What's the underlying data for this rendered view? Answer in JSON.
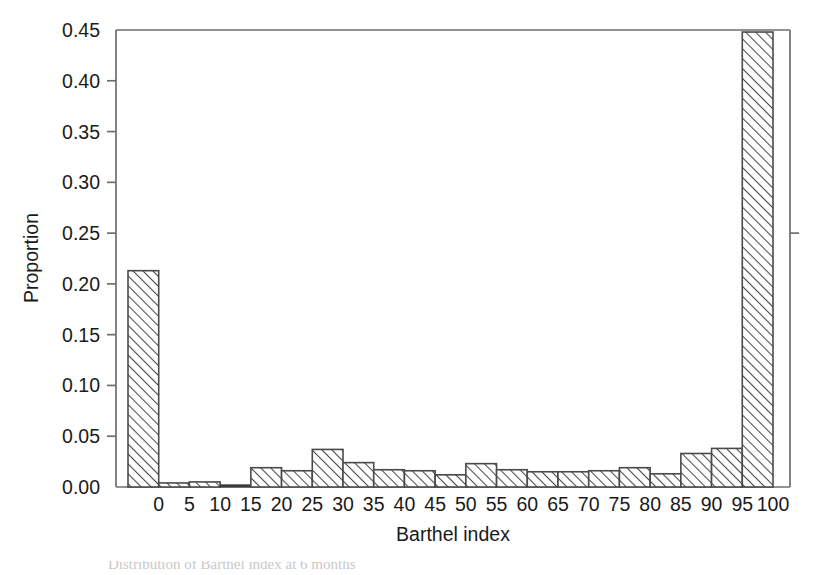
{
  "chart_data": {
    "type": "bar",
    "title": "",
    "xlabel": "Barthel index",
    "ylabel": "Proportion",
    "ylim": [
      0.0,
      0.45
    ],
    "ytick_labels": [
      "0.00",
      "0.05",
      "0.10",
      "0.15",
      "0.20",
      "0.25",
      "0.30",
      "0.35",
      "0.40",
      "0.45"
    ],
    "ytick_values": [
      0.0,
      0.05,
      0.1,
      0.15,
      0.2,
      0.25,
      0.3,
      0.35,
      0.4,
      0.45
    ],
    "xtick_labels": [
      "0",
      "5",
      "10",
      "15",
      "20",
      "25",
      "30",
      "35",
      "40",
      "45",
      "50",
      "55",
      "60",
      "65",
      "70",
      "75",
      "80",
      "85",
      "90",
      "95",
      "100"
    ],
    "xtick_values": [
      0,
      5,
      10,
      15,
      20,
      25,
      30,
      35,
      40,
      45,
      50,
      55,
      60,
      65,
      70,
      75,
      80,
      85,
      90,
      95,
      100
    ],
    "grid": false,
    "legend": false,
    "bar_style": "diagonal-hatch",
    "categories": [
      "0",
      "5",
      "10",
      "15",
      "20",
      "25",
      "30",
      "35",
      "40",
      "45",
      "50",
      "55",
      "60",
      "65",
      "70",
      "75",
      "80",
      "85",
      "90",
      "95",
      "100"
    ],
    "values": [
      0.213,
      0.004,
      0.005,
      0.0,
      0.019,
      0.016,
      0.037,
      0.024,
      0.017,
      0.016,
      0.012,
      0.023,
      0.017,
      0.015,
      0.015,
      0.016,
      0.019,
      0.013,
      0.033,
      0.038,
      0.448
    ]
  },
  "axes": {
    "y_axis_label": "Proportion",
    "x_axis_label": "Barthel index"
  },
  "caption": {
    "partial_line": "Distribution of Barthel index at 6 months"
  }
}
